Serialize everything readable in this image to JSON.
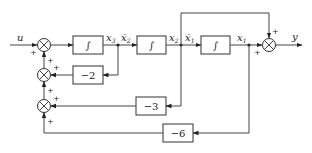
{
  "diagram": {
    "type": "state-variable block diagram",
    "signals": {
      "input": "u",
      "output": "y",
      "x3": "x",
      "x3_sub": "3",
      "x2dot": "ẋ",
      "x2dot_sub": "2",
      "x2": "x",
      "x2_sub": "2",
      "x1dot": "ẋ",
      "x1dot_sub": "1",
      "x1": "x",
      "x1_sub": "1"
    },
    "blocks": [
      {
        "id": "int1",
        "label": "∫"
      },
      {
        "id": "int2",
        "label": "∫"
      },
      {
        "id": "int3",
        "label": "∫"
      },
      {
        "id": "gain_a",
        "label": "−2"
      },
      {
        "id": "gain_b",
        "label": "−3"
      },
      {
        "id": "gain_c",
        "label": "−6"
      }
    ],
    "signs": {
      "sum1_left": "+",
      "sum1_bottom": "+",
      "sum2_right": "+",
      "sum2_bottom": "+",
      "sum3_right": "+",
      "sum3_bottom": "+",
      "sum_out_top": "+",
      "sum_out_left": "+"
    }
  }
}
